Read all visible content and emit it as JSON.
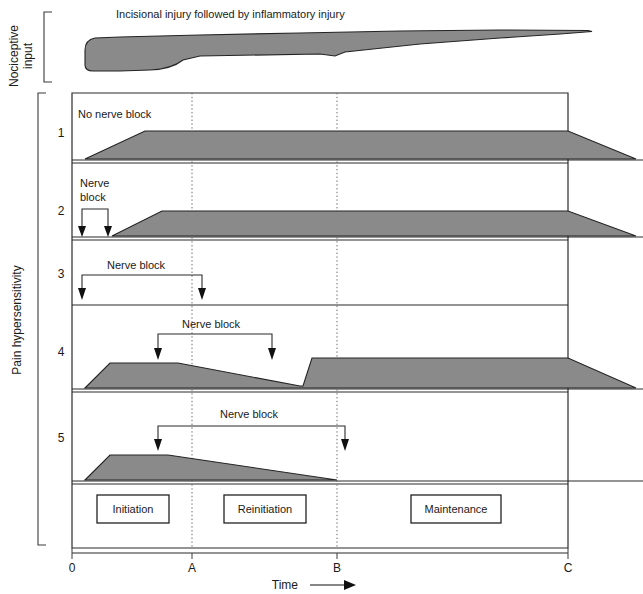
{
  "figure": {
    "title_top": "Incisional injury followed by inflammatory injury",
    "y_axis_label_top": "Nociceptive\ninput",
    "y_axis_label_top_line1": "Nociceptive",
    "y_axis_label_top_line2": "input",
    "y_axis_label_main": "Pain hypersensitivity",
    "x_axis_label": "Time",
    "x_axis_arrow": "⟶",
    "fill_color": "#8a8a8a",
    "stroke_color": "#242424"
  },
  "axis": {
    "ticks": [
      {
        "label": "0",
        "x": 72
      },
      {
        "label": "A",
        "x": 192
      },
      {
        "label": "B",
        "x": 337
      },
      {
        "label": "C",
        "x": 568
      }
    ]
  },
  "phases": [
    {
      "label": "Initiation",
      "x": 97,
      "width": 72
    },
    {
      "label": "Reinitiation",
      "x": 224,
      "width": 82
    },
    {
      "label": "Maintenance",
      "x": 411,
      "width": 90
    }
  ],
  "panels": [
    {
      "number": "1",
      "annotation": "No nerve block",
      "annotation_x": 78,
      "annotation_y": 114,
      "has_nerve_block_bracket": false,
      "nerve_block_label": null,
      "region_path": "M 85,160 L 145,131 L 568,131 L 634,160 Z"
    },
    {
      "number": "2",
      "annotation": null,
      "annotation_x": 78,
      "annotation_y": 188,
      "has_nerve_block_bracket": true,
      "nerve_block_label": "Nerve\nblock",
      "nerve_block_label_line1": "Nerve",
      "nerve_block_label_line2": "block",
      "bracket_left_x": 82,
      "bracket_right_x": 108,
      "bracket_top_y": 208,
      "arrow_tip_y": 234,
      "label_x": 80,
      "label_y1": 187,
      "label_y2": 200,
      "region_path": "M 110,237 L 160,211 L 568,211 L 634,237 Z"
    },
    {
      "number": "3",
      "annotation": null,
      "annotation_x": 105,
      "annotation_y": 264,
      "has_nerve_block_bracket": true,
      "nerve_block_label": "Nerve block",
      "bracket_left_x": 82,
      "bracket_right_x": 202,
      "bracket_top_y": 273,
      "arrow_tip_y": 298,
      "label_x": 107,
      "label_y1": 266,
      "region_path": ""
    },
    {
      "number": "4",
      "annotation": null,
      "annotation_x": 180,
      "annotation_y": 324,
      "has_nerve_block_bracket": true,
      "nerve_block_label": "Nerve block",
      "bracket_left_x": 158,
      "bracket_right_x": 272,
      "bracket_top_y": 333,
      "arrow_tip_y": 358,
      "label_x": 182,
      "label_y1": 325,
      "region_path": "M 85,389 L 110,363 L 179,363 L 300,387 L 303,387 L 312,358 L 568,358 L 634,389 Z"
    },
    {
      "number": "5",
      "annotation": null,
      "annotation_x": 218,
      "annotation_y": 414,
      "has_nerve_block_bracket": true,
      "nerve_block_label": "Nerve block",
      "bracket_left_x": 158,
      "bracket_right_x": 345,
      "bracket_top_y": 424,
      "arrow_tip_y": 450,
      "label_x": 220,
      "label_y1": 415,
      "region_path": "M 85,481 L 110,455 L 168,455 L 337,481 Z"
    }
  ],
  "row_numbers": [
    {
      "label": "1",
      "y": 133
    },
    {
      "label": "2",
      "y": 211
    },
    {
      "label": "3",
      "y": 274
    },
    {
      "label": "4",
      "y": 352
    },
    {
      "label": "5",
      "y": 438
    }
  ],
  "nociceptive_curve": {
    "description": "Nociceptive input wedge: thick at incision, tapering over time",
    "path": "M 88,38 L 580,32 L 588,31 L 592,31 L 450,44 L 340,50 L 335,56 L 200,57 L 190,58 L 120,69 L 104,70 L 92,68 L 86,61 L 85,48 Z"
  }
}
